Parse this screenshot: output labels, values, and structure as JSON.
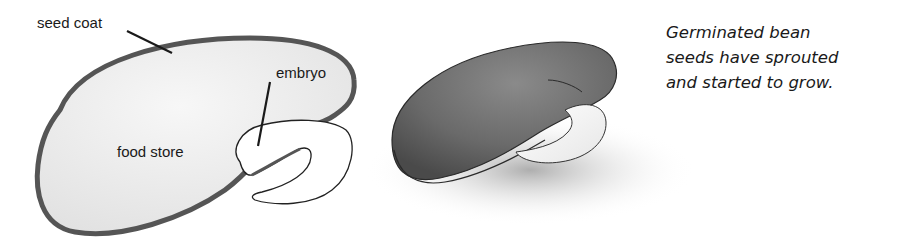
{
  "diagram": {
    "cross_section": {
      "labels": {
        "seed_coat": "seed coat",
        "embryo": "embryo",
        "food_store": "food store"
      }
    },
    "germinated_seed": {
      "description": "Whole germinated bean seed with sprouting embryo"
    },
    "caption": {
      "lines": [
        "Germinated bean",
        "seeds have sprouted",
        "and started to grow."
      ]
    },
    "colors": {
      "seed_coat": "#555555",
      "food_store_fill": "#ececec",
      "embryo_fill": "#ffffff",
      "whole_seed": "#6e6e6e",
      "text": "#1a1a1a"
    }
  }
}
